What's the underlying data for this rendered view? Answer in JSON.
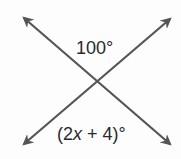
{
  "diagram": {
    "type": "intersecting-lines",
    "line_color": "#555555",
    "text_color": "#2a2a2a",
    "lines": [
      {
        "name": "line-a",
        "from": [
          21,
          15
        ],
        "to": [
          173,
          147
        ]
      },
      {
        "name": "line-b",
        "from": [
          21,
          147
        ],
        "to": [
          173,
          16
        ]
      }
    ],
    "intersection": [
      96,
      82
    ],
    "angles": {
      "top": {
        "text": "100°"
      },
      "bottom": {
        "open": "(2",
        "var": "x",
        "rest": " + 4)°"
      }
    }
  }
}
